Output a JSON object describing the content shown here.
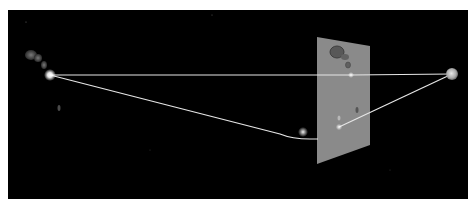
{
  "diagram": {
    "type": "gravitational-lensing-illustration",
    "background": "#000000",
    "frame": {
      "x": 8,
      "y": 10,
      "width": 460,
      "height": 189
    },
    "source": {
      "label": "",
      "x": 50,
      "y": 75,
      "color": "#ffffff"
    },
    "observer": {
      "label": "",
      "x": 452,
      "y": 74,
      "color": "#cfcfcf"
    },
    "lens_object": {
      "x": 303,
      "y": 132
    },
    "image_plane": {
      "color": "#8a8a8a",
      "corners": [
        [
          317,
          37
        ],
        [
          370,
          46
        ],
        [
          370,
          145
        ],
        [
          317,
          164
        ]
      ],
      "images": [
        {
          "x": 351,
          "y": 75
        },
        {
          "x": 339,
          "y": 127
        }
      ]
    },
    "light_paths": [
      {
        "name": "direct-path",
        "points": [
          [
            50,
            75
          ],
          [
            351,
            75
          ],
          [
            452,
            74
          ]
        ]
      },
      {
        "name": "bent-path",
        "points": [
          [
            50,
            75
          ],
          [
            280,
            138
          ],
          [
            317,
            138
          ],
          [
            452,
            74
          ]
        ]
      }
    ],
    "colors": {
      "path": "#e6e6e6",
      "glow": "#ffffff",
      "blob": "#5a5a5a"
    }
  }
}
